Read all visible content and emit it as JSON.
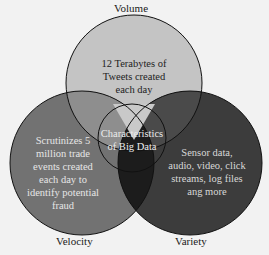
{
  "diagram": {
    "title": "Characteristics of Big Data",
    "center_label_line1": "Characteristics",
    "center_label_line2": "of Big Data",
    "circles": [
      {
        "name": "Volume",
        "color": "#c4c4c4",
        "text_lines": [
          "12 Terabytes of",
          "Tweets created",
          "each day"
        ]
      },
      {
        "name": "Velocity",
        "color": "#727272",
        "text_lines": [
          "Scrutinizes 5",
          "million trade",
          "events created",
          "each day to",
          "identify potential",
          "fraud"
        ]
      },
      {
        "name": "Variety",
        "color": "#3c3c3c",
        "text_lines": [
          "Sensor data,",
          "audio, video, click",
          "streams, log files",
          "ang more"
        ]
      }
    ]
  }
}
